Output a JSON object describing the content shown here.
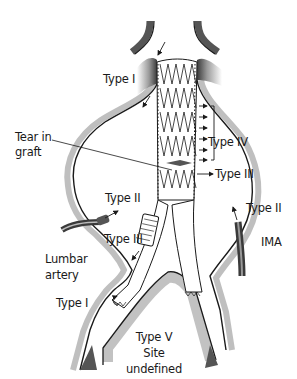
{
  "diagram": {
    "labels": {
      "type1_top": "Type I",
      "tear_line1": "Tear in",
      "tear_line2": "graft",
      "type4": "Type IV",
      "type3_right": "Type III",
      "type2_left": "Type II",
      "type2_right": "Type II",
      "type3_left": "Type III",
      "lumbar_line1": "Lumbar",
      "lumbar_line2": "artery",
      "ima": "IMA",
      "type1_bottom": "Type I",
      "type5_line1": "Type V",
      "type5_line2": "Site",
      "type5_line3": "undefined"
    },
    "colors": {
      "ink": "#1a1a1a",
      "wall_shadow": "#8a8a8a",
      "background": "#ffffff"
    }
  }
}
